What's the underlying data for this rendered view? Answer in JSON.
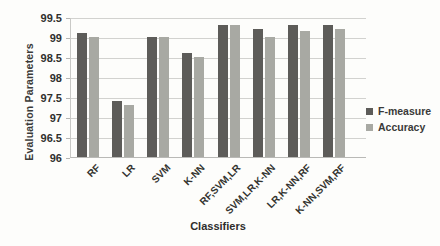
{
  "chart_data": {
    "type": "bar",
    "title": "",
    "xlabel": "Classifiers",
    "ylabel": "Evaluation Parameters",
    "categories": [
      "RF",
      "LR",
      "SVM",
      "K-NN",
      "RF,SVM,LR",
      "SVM,LR,K-NN",
      "LR,K-NN,RF",
      "K-NN,SVM,RF"
    ],
    "series": [
      {
        "name": "F-measure",
        "color": "#5d5c59",
        "values": [
          99.1,
          97.4,
          99.0,
          98.6,
          99.3,
          99.2,
          99.3,
          99.3
        ]
      },
      {
        "name": "Accuracy",
        "color": "#a8a9a3",
        "values": [
          99.0,
          97.3,
          99.0,
          98.5,
          99.3,
          99.0,
          99.15,
          99.2
        ]
      }
    ],
    "ylim": [
      96,
      99.5
    ],
    "ytick_step": 0.5,
    "ytick_labels": [
      "99.5",
      "99",
      "98.5",
      "98",
      "97.5",
      "97",
      "96.5",
      "96"
    ],
    "grid": true,
    "legend_position": "right",
    "colors": {
      "gridline": "#d2d2cf",
      "axis_text": "#2f2f2d",
      "background": "#fdfdfb"
    }
  }
}
